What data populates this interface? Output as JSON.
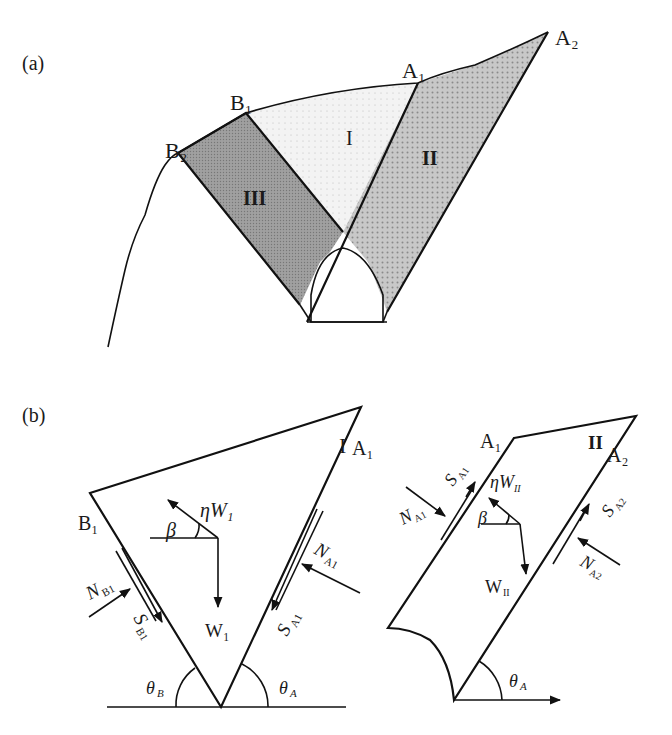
{
  "panel_a": {
    "label": "(a)",
    "points": {
      "B2": "B₂",
      "B1": "B₁",
      "A1": "A₁",
      "A2": "A₂"
    },
    "blocks": {
      "I": "I",
      "II": "II",
      "III": "III"
    }
  },
  "panel_b": {
    "label": "(b)",
    "left": {
      "block": "I",
      "A1": "A₁",
      "B1": "B₁",
      "eta_w": "ηW₁",
      "beta": "β",
      "w": "W₁",
      "n_a1": "N",
      "n_a1_sub": "A1",
      "s_a1": "S",
      "s_a1_sub": "A1",
      "n_b1": "N",
      "n_b1_sub": "B1",
      "s_b1": "S",
      "s_b1_sub": "B1",
      "theta_b": "θ",
      "theta_b_sub": "B",
      "theta_a": "θ",
      "theta_a_sub": "A"
    },
    "right": {
      "block": "II",
      "A1": "A₁",
      "A2": "A₂",
      "eta_w": "ηW",
      "eta_w_sub": "II",
      "beta": "β",
      "w": "W",
      "w_sub": "II",
      "n_a1": "N",
      "n_a1_sub": "A1",
      "s_a1": "S",
      "s_a1_sub": "A1",
      "n_a2": "N",
      "n_a2_sub": "A2",
      "s_a2": "S",
      "s_a2_sub": "A2",
      "theta_a": "θ",
      "theta_a_sub": "A"
    }
  },
  "colors": {
    "block_I": "#f1f1f1",
    "block_II": "#c4c4c4",
    "block_III": "#9a9a9a",
    "stroke": "#111111"
  }
}
